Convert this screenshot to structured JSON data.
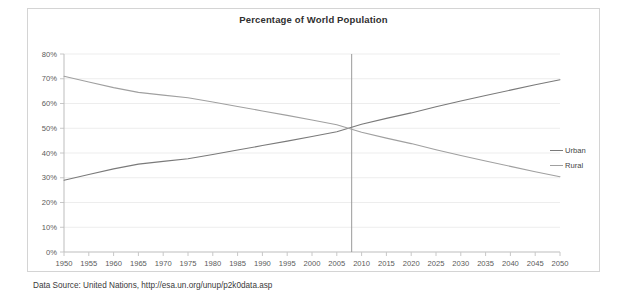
{
  "chart_data": {
    "type": "line",
    "title": "Percentage of World Population",
    "xlabel": "",
    "ylabel": "",
    "xlim": [
      1950,
      2050
    ],
    "ylim": [
      0,
      80
    ],
    "grid": true,
    "grid_axis": "y",
    "legend_position": "right",
    "x": [
      1950,
      1955,
      1960,
      1965,
      1970,
      1975,
      1980,
      1985,
      1990,
      1995,
      2000,
      2005,
      2010,
      2015,
      2020,
      2025,
      2030,
      2035,
      2040,
      2045,
      2050
    ],
    "categories": [
      "1950",
      "1955",
      "1960",
      "1965",
      "1970",
      "1975",
      "1980",
      "1985",
      "1990",
      "1995",
      "2000",
      "2005",
      "2010",
      "2015",
      "2020",
      "2025",
      "2030",
      "2035",
      "2040",
      "2045",
      "2050"
    ],
    "ytick_labels": [
      "0%",
      "10%",
      "20%",
      "30%",
      "40%",
      "50%",
      "60%",
      "70%",
      "80%"
    ],
    "ytick_values": [
      0,
      10,
      20,
      30,
      40,
      50,
      60,
      70,
      80
    ],
    "series": [
      {
        "name": "Urban",
        "color": "#7a7a7a",
        "values": [
          29.0,
          31.3,
          33.6,
          35.5,
          36.6,
          37.7,
          39.4,
          41.2,
          43.0,
          44.8,
          46.7,
          48.6,
          51.6,
          54.0,
          56.2,
          58.7,
          61.0,
          63.2,
          65.4,
          67.6,
          69.6
        ]
      },
      {
        "name": "Rural",
        "color": "#a0a0a0",
        "values": [
          71.0,
          68.7,
          66.4,
          64.5,
          63.4,
          62.3,
          60.6,
          58.8,
          57.0,
          55.2,
          53.3,
          51.4,
          48.4,
          46.0,
          43.8,
          41.3,
          39.0,
          36.8,
          34.6,
          32.4,
          30.4
        ]
      }
    ],
    "annotations": [
      {
        "name": "crossover-marker",
        "type": "vertical-line",
        "x": 2008,
        "label": "",
        "color": "#9a9a9a"
      }
    ]
  },
  "source": {
    "text": "Data Source: United Nations, http://esa.un.org/unup/p2k0data.asp"
  },
  "legend": {
    "items": [
      {
        "label": "Urban",
        "color": "#7a7a7a"
      },
      {
        "label": "Rural",
        "color": "#a0a0a0"
      }
    ]
  }
}
